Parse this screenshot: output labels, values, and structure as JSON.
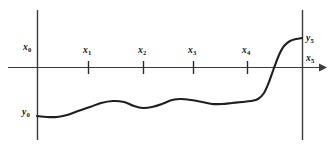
{
  "figure": {
    "background_color": "#ffffff",
    "stroke_color": "#1f1f1f",
    "axis_color": "#3b3b3b",
    "width": 333,
    "height": 144
  },
  "axes": {
    "horizontal": {
      "name": "x-axis",
      "y": 67,
      "x_start": 8,
      "x_end": 325,
      "has_arrow": true,
      "arrow_direction": "right"
    },
    "boundaries": [
      {
        "name": "left-boundary",
        "x": 37,
        "y_top": 10,
        "y_bottom": 140
      },
      {
        "name": "right-boundary",
        "x": 302,
        "y_top": 10,
        "y_bottom": 140
      }
    ]
  },
  "ticks": [
    {
      "label": "x",
      "sub": "1",
      "x": 88
    },
    {
      "label": "x",
      "sub": "2",
      "x": 143
    },
    {
      "label": "x",
      "sub": "3",
      "x": 193
    },
    {
      "label": "x",
      "sub": "4",
      "x": 247
    }
  ],
  "labels": [
    {
      "name": "label-x0",
      "base": "x",
      "sub": "0",
      "x": 23,
      "y": 43
    },
    {
      "name": "label-x1",
      "base": "x",
      "sub": "1",
      "x": 83,
      "y": 46
    },
    {
      "name": "label-x2",
      "base": "x",
      "sub": "2",
      "x": 138,
      "y": 46
    },
    {
      "name": "label-x3",
      "base": "x",
      "sub": "3",
      "x": 188,
      "y": 46
    },
    {
      "name": "label-x4",
      "base": "x",
      "sub": "4",
      "x": 242,
      "y": 46
    },
    {
      "name": "label-x5",
      "base": "x",
      "sub": "5",
      "x": 306,
      "y": 54
    },
    {
      "name": "label-y5",
      "base": "y",
      "sub": "5",
      "x": 306,
      "y": 34
    },
    {
      "name": "label-y0",
      "base": "y",
      "sub": "0",
      "x": 22,
      "y": 108
    }
  ],
  "chart_data": {
    "type": "line",
    "xlabel": "",
    "ylabel": "",
    "grid": false,
    "legend": null,
    "axis_style": "single horizontal axis with right arrow, two vertical boundary lines",
    "node_labels": [
      "x0",
      "x1",
      "x2",
      "x3",
      "x4",
      "x5"
    ],
    "endpoint_value_labels": [
      "y0",
      "y5"
    ],
    "node_pixel_x": [
      37,
      88,
      143,
      193,
      247,
      302
    ],
    "axis_pixel_y": 67,
    "curve_pixel_points": [
      [
        37,
        116
      ],
      [
        47,
        117
      ],
      [
        57,
        117
      ],
      [
        67,
        115
      ],
      [
        78,
        111
      ],
      [
        90,
        107
      ],
      [
        101,
        103
      ],
      [
        113,
        101
      ],
      [
        124,
        102
      ],
      [
        134,
        106
      ],
      [
        143,
        108
      ],
      [
        152,
        107
      ],
      [
        162,
        104
      ],
      [
        172,
        100
      ],
      [
        181,
        99
      ],
      [
        191,
        100
      ],
      [
        202,
        102
      ],
      [
        212,
        104
      ],
      [
        222,
        104
      ],
      [
        232,
        103
      ],
      [
        242,
        102
      ],
      [
        251,
        101
      ],
      [
        258,
        99
      ],
      [
        264,
        93
      ],
      [
        269,
        82
      ],
      [
        274,
        68
      ],
      [
        279,
        55
      ],
      [
        284,
        46
      ],
      [
        290,
        41
      ],
      [
        296,
        39
      ],
      [
        302,
        38
      ]
    ],
    "curve_description": "A smooth monotone-ish curve starting low at y0 on the left boundary, undulating gently across x1 through x4, then rising steeply in an S-shape after x4 up to y5 on the right boundary above the axis.",
    "note": "Curve is below the axis between x0 and roughly x=276, crosses the axis once near x=276, and ends above the axis at y5."
  }
}
